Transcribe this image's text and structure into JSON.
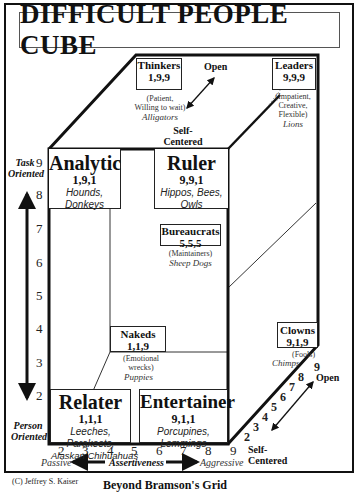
{
  "title": "DIFFICULT PEOPLE CUBE",
  "types": {
    "thinkers": {
      "name": "Thinkers",
      "code": "1,9,9",
      "desc1": "(Patient,",
      "desc2": "Willing to wait)",
      "animals": "Alligators"
    },
    "leaders": {
      "name": "Leaders",
      "code": "9,9,9",
      "desc1": "(Impatient,",
      "desc2": "Creative,",
      "desc3": "Flexible)",
      "animals": "Lions"
    },
    "analytic": {
      "name": "Analytic",
      "code": "1,9,1",
      "animals1": "Hounds,",
      "animals2": "Donkeys"
    },
    "ruler": {
      "name": "Ruler",
      "code": "9,9,1",
      "animals1": "Hippos, Bees,",
      "animals2": "Owls"
    },
    "bureaucrats": {
      "name": "Bureaucrats",
      "code": "5,5,5",
      "desc": "(Maintainers)",
      "animals": "Sheep Dogs"
    },
    "nakeds": {
      "name": "Nakeds",
      "code": "1,1,9",
      "desc1": "(Emotional",
      "desc2": "wrecks)",
      "animals": "Puppies"
    },
    "clowns": {
      "name": "Clowns",
      "code": "9,1,9",
      "desc": "(Fools)",
      "animals": "Chimps"
    },
    "relater": {
      "name": "Relater",
      "code": "1,1,1",
      "animals1": "Leeches,",
      "animals2": "Parakeets,",
      "animals3": "Alaskan Chihuahuas"
    },
    "entertainer": {
      "name": "Entertainer",
      "code": "9,1,1",
      "animals1": "Porcupines,",
      "animals2": "Lemmings"
    }
  },
  "axes": {
    "vertical": {
      "top_label_1": "Task",
      "top_label_2": "Oriented",
      "bottom_label_1": "Person",
      "bottom_label_2": "Oriented",
      "ticks": [
        "9",
        "8",
        "7",
        "6",
        "5",
        "4",
        "3",
        "2"
      ]
    },
    "horizontal": {
      "label": "Assertiveness",
      "left_end": "Passive",
      "right_end": "Aggressive",
      "ticks": [
        "2",
        "3",
        "4",
        "5",
        "6",
        "7",
        "8",
        "9"
      ]
    },
    "depth_top": {
      "open": "Open",
      "self_1": "Self-",
      "self_2": "Centered"
    },
    "depth_bottom": {
      "open": "Open",
      "self_1": "Self-",
      "self_2": "Centered",
      "ticks": [
        "2",
        "3",
        "4",
        "5",
        "6",
        "7",
        "8",
        "9"
      ]
    }
  },
  "footer": {
    "copyright": "(C) Jeffrey S. Kaiser",
    "subtitle": "Beyond Bramson's Grid"
  }
}
